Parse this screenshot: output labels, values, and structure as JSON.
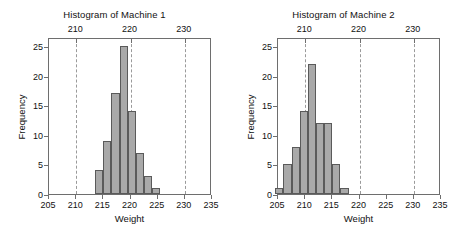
{
  "figure": {
    "background": "#ffffff",
    "bar_fill": "#a9a9a9",
    "bar_edge": "#5a5a5a",
    "axis_color": "#6e6e6e",
    "grid_color": "#9a9a9a"
  },
  "charts": [
    {
      "type": "bar",
      "title": "Histogram of Machine 1",
      "xlabel": "Weight",
      "ylabel": "Frequency",
      "xlim": [
        205,
        235
      ],
      "ylim": [
        0,
        26.5
      ],
      "xticks": [
        205,
        210,
        215,
        220,
        225,
        230,
        235
      ],
      "xticklabels": [
        "205",
        "210",
        "215",
        "220",
        "225",
        "230",
        "235"
      ],
      "yticks": [
        0,
        5,
        10,
        15,
        20,
        25
      ],
      "yticklabels": [
        "0",
        "5",
        "10",
        "15",
        "20",
        "25"
      ],
      "top_axis_ticks": [
        210,
        220,
        230
      ],
      "top_axis_ticklabels": [
        "210",
        "220",
        "230"
      ],
      "gridlines_x": [
        210,
        220,
        230
      ],
      "grid": "dotted-vertical",
      "bin_width": 1.5,
      "bin_edges": [
        213.5,
        215.0,
        216.5,
        218.0,
        219.5,
        221.0,
        222.5,
        224.0,
        225.5
      ],
      "bin_centers": [
        214.25,
        215.75,
        217.25,
        218.75,
        220.25,
        221.75,
        223.25,
        224.75
      ],
      "values": [
        4,
        9,
        17,
        25,
        14,
        7,
        3,
        1
      ],
      "legend": null
    },
    {
      "type": "bar",
      "title": "Histogram of Machine 2",
      "xlabel": "Weight",
      "ylabel": "Frequency",
      "xlim": [
        205,
        235
      ],
      "ylim": [
        0,
        26.5
      ],
      "xticks": [
        205,
        210,
        215,
        220,
        225,
        230,
        235
      ],
      "xticklabels": [
        "205",
        "210",
        "215",
        "220",
        "225",
        "230",
        "235"
      ],
      "yticks": [
        0,
        5,
        10,
        15,
        20,
        25
      ],
      "yticklabels": [
        "0",
        "5",
        "10",
        "15",
        "20",
        "25"
      ],
      "top_axis_ticks": [
        210,
        220,
        230
      ],
      "top_axis_ticklabels": [
        "210",
        "220",
        "230"
      ],
      "gridlines_x": [
        210,
        220,
        230
      ],
      "grid": "dotted-vertical",
      "bin_width": 1.5,
      "bin_edges": [
        204.5,
        206.0,
        207.5,
        209.0,
        210.5,
        212.0,
        213.5,
        215.0,
        216.5,
        218.0
      ],
      "bin_centers": [
        205.25,
        206.75,
        208.25,
        209.75,
        211.25,
        212.75,
        214.25,
        215.75,
        217.25
      ],
      "values": [
        1,
        5,
        8,
        14,
        22,
        12,
        12,
        5,
        1
      ],
      "legend": null
    }
  ],
  "chart_data": {
    "type": "bar",
    "layout": "two-panel-side-by-side",
    "panels": [
      {
        "title": "Histogram of Machine 1",
        "xlabel": "Weight",
        "ylabel": "Frequency",
        "xlim": [
          205,
          235
        ],
        "ylim": [
          0,
          26.5
        ],
        "xticks": [
          205,
          210,
          215,
          220,
          225,
          230,
          235
        ],
        "yticks": [
          0,
          5,
          10,
          15,
          20,
          25
        ],
        "secondary_top_xticks": [
          210,
          220,
          230
        ],
        "gridlines_x": [
          210,
          220,
          230
        ],
        "categories": [
          "213.5-215.0",
          "215.0-216.5",
          "216.5-218.0",
          "218.0-219.5",
          "219.5-221.0",
          "221.0-222.5",
          "222.5-224.0",
          "224.0-225.5"
        ],
        "bin_centers": [
          214.25,
          215.75,
          217.25,
          218.75,
          220.25,
          221.75,
          223.25,
          224.75
        ],
        "values": [
          4,
          9,
          17,
          25,
          14,
          7,
          3,
          1
        ],
        "total_count": 80
      },
      {
        "title": "Histogram of Machine 2",
        "xlabel": "Weight",
        "ylabel": "Frequency",
        "xlim": [
          205,
          235
        ],
        "ylim": [
          0,
          26.5
        ],
        "xticks": [
          205,
          210,
          215,
          220,
          225,
          230,
          235
        ],
        "yticks": [
          0,
          5,
          10,
          15,
          20,
          25
        ],
        "secondary_top_xticks": [
          210,
          220,
          230
        ],
        "gridlines_x": [
          210,
          220,
          230
        ],
        "categories": [
          "204.5-206.0",
          "206.0-207.5",
          "207.5-209.0",
          "209.0-210.5",
          "210.5-212.0",
          "212.0-213.5",
          "213.5-215.0",
          "215.0-216.5",
          "216.5-218.0"
        ],
        "bin_centers": [
          205.25,
          206.75,
          208.25,
          209.75,
          211.25,
          212.75,
          214.25,
          215.75,
          217.25
        ],
        "values": [
          1,
          5,
          8,
          14,
          22,
          12,
          12,
          5,
          1
        ],
        "total_count": 80
      }
    ]
  }
}
